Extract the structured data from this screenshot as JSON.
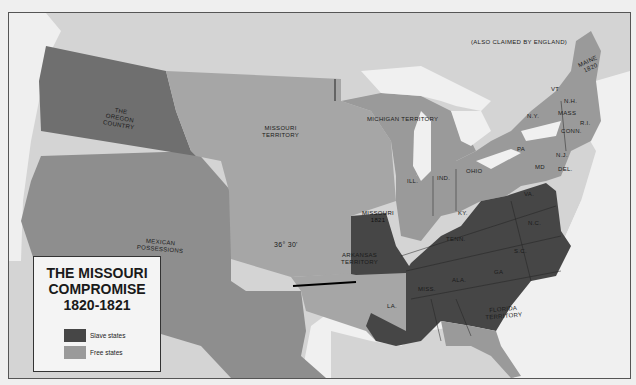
{
  "map": {
    "title_lines": [
      "THE MISSOURI",
      "COMPROMISE",
      "1820-1821"
    ],
    "legend": [
      {
        "label": "Slave states",
        "color": "#464646"
      },
      {
        "label": "Free states",
        "color": "#9a9a9a"
      }
    ],
    "colors": {
      "slave": "#464646",
      "free": "#9a9a9a",
      "territory_free": "#a6a6a6",
      "oregon": "#6f6f6f",
      "mexico": "#8e8e8e",
      "canada": "#d4d4d4",
      "water": "#f1f1f1",
      "compromise_line": "#000000"
    },
    "labels": {
      "claim_note": "(ALSO CLAIMED BY ENGLAND)",
      "maine": [
        "MAINE",
        "1820"
      ],
      "vt": "VT",
      "nh": "N.H.",
      "ny": "N.Y.",
      "mass": "MASS",
      "ri": "R.I.",
      "conn": "CONN.",
      "pa": "PA",
      "nj": "N.J.",
      "md": "MD",
      "del": "DEL.",
      "va": "VA.",
      "nc": "N.C.",
      "sc": "S.C.",
      "ga": "GA",
      "ala": "ALA.",
      "miss": "MISS.",
      "la": "LA.",
      "tenn": "TENN.",
      "ky": "KY.",
      "ohio": "OHIO",
      "ind": "IND.",
      "ill": "ILL.",
      "missouri": [
        "MISSOURI",
        "1821"
      ],
      "michigan": "MICHIGAN TERRITORY",
      "missouri_territory": [
        "MISSOURI",
        "TERRITORY"
      ],
      "oregon": [
        "THE",
        "OREGON",
        "COUNTRY"
      ],
      "mexican": [
        "MEXICAN",
        "POSSESSIONS"
      ],
      "arkansas": [
        "ARKANSAS",
        "TERRITORY"
      ],
      "florida": [
        "FLORIDA",
        "TERRITORY"
      ],
      "latitude": "36° 30'"
    }
  }
}
